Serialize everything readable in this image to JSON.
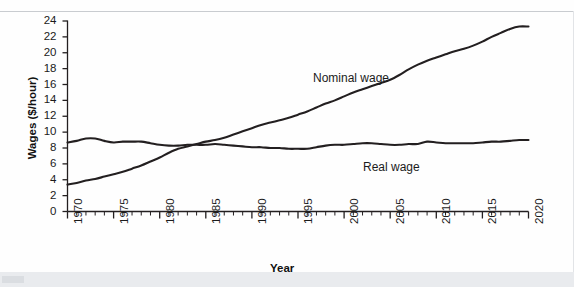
{
  "figure": {
    "background_color": "#fefefe",
    "line_color": "#231f20",
    "axis_color": "#231f20"
  },
  "chart_data": {
    "type": "line",
    "title": "",
    "xlabel": "Year",
    "ylabel": "Wages ($/hour)",
    "xlim": [
      1970,
      2020
    ],
    "ylim": [
      0,
      24
    ],
    "grid": false,
    "legend_position": "inline-annotation",
    "x_tick_labels": [
      "1970",
      "1975",
      "1980",
      "1985",
      "1990",
      "1995",
      "2000",
      "2005",
      "2010",
      "2015",
      "2020"
    ],
    "x_tick_values": [
      1970,
      1975,
      1980,
      1985,
      1990,
      1995,
      2000,
      2005,
      2010,
      2015,
      2020
    ],
    "x_minor_tick_step": 1,
    "y_tick_labels": [
      "0",
      "2",
      "4",
      "6",
      "8",
      "10",
      "12",
      "14",
      "16",
      "18",
      "20",
      "22",
      "24"
    ],
    "y_tick_values": [
      0,
      2,
      4,
      6,
      8,
      10,
      12,
      14,
      16,
      18,
      20,
      22,
      24
    ],
    "x": [
      1970,
      1971,
      1972,
      1973,
      1974,
      1975,
      1976,
      1977,
      1978,
      1979,
      1980,
      1981,
      1982,
      1983,
      1984,
      1985,
      1986,
      1987,
      1988,
      1989,
      1990,
      1991,
      1992,
      1993,
      1994,
      1995,
      1996,
      1997,
      1998,
      1999,
      2000,
      2001,
      2002,
      2003,
      2004,
      2005,
      2006,
      2007,
      2008,
      2009,
      2010,
      2011,
      2012,
      2013,
      2014,
      2015,
      2016,
      2017,
      2018,
      2019,
      2020
    ],
    "series": [
      {
        "name": "Nominal wage",
        "label": "Nominal wage",
        "color": "#231f20",
        "values": [
          3.4,
          3.6,
          3.9,
          4.1,
          4.4,
          4.7,
          5.0,
          5.4,
          5.8,
          6.3,
          6.8,
          7.4,
          7.9,
          8.2,
          8.5,
          8.8,
          9.0,
          9.3,
          9.7,
          10.1,
          10.5,
          10.9,
          11.2,
          11.5,
          11.8,
          12.2,
          12.6,
          13.1,
          13.6,
          14.0,
          14.5,
          15.0,
          15.4,
          15.8,
          16.2,
          16.6,
          17.2,
          17.9,
          18.5,
          19.0,
          19.4,
          19.8,
          20.2,
          20.5,
          20.9,
          21.4,
          22.0,
          22.5,
          23.0,
          23.3,
          23.3
        ]
      },
      {
        "name": "Real wage",
        "label": "Real wage",
        "color": "#231f20",
        "values": [
          8.7,
          8.9,
          9.2,
          9.2,
          8.9,
          8.7,
          8.8,
          8.8,
          8.8,
          8.6,
          8.4,
          8.3,
          8.3,
          8.4,
          8.4,
          8.4,
          8.5,
          8.4,
          8.3,
          8.2,
          8.1,
          8.1,
          8.0,
          8.0,
          7.9,
          7.9,
          7.9,
          8.1,
          8.3,
          8.4,
          8.4,
          8.5,
          8.6,
          8.6,
          8.5,
          8.4,
          8.4,
          8.5,
          8.5,
          8.8,
          8.7,
          8.6,
          8.6,
          8.6,
          8.6,
          8.7,
          8.8,
          8.8,
          8.9,
          9.0,
          9.0
        ]
      }
    ],
    "annotations": [
      {
        "text": "Nominal wage",
        "x": 1997,
        "y": 17.5
      },
      {
        "text": "Real wage",
        "x": 2003,
        "y": 6.7
      }
    ]
  }
}
